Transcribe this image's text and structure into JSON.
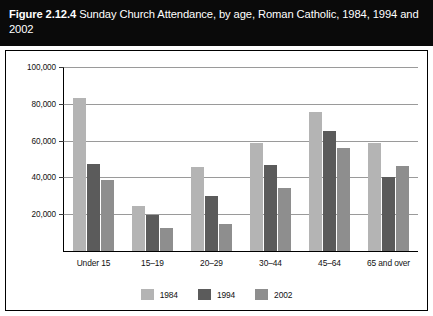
{
  "figure": {
    "number": "Figure 2.12.4",
    "caption": "Sunday Church Attendance, by age, Roman Catholic, 1984, 1994 and 2002"
  },
  "chart_data": {
    "type": "bar",
    "title": "Sunday Church Attendance, by age, Roman Catholic, 1984, 1994 and 2002",
    "xlabel": "",
    "ylabel": "",
    "ylim": [
      0,
      100000
    ],
    "yticks": [
      0,
      20000,
      40000,
      60000,
      80000,
      100000
    ],
    "ytick_labels": [
      "0",
      "20,000",
      "40,000",
      "60,000",
      "80,000",
      "100,000"
    ],
    "grid": true,
    "legend_position": "bottom",
    "categories": [
      "Under 15",
      "15–19",
      "20–29",
      "30–44",
      "45–64",
      "65 and over"
    ],
    "series": [
      {
        "name": "1984",
        "color": "#b4b4b4",
        "values": [
          83000,
          24500,
          45500,
          58500,
          75500,
          58500
        ]
      },
      {
        "name": "1994",
        "color": "#5b5b5b",
        "values": [
          47500,
          19500,
          30000,
          47000,
          65000,
          40000
        ]
      },
      {
        "name": "2002",
        "color": "#8e8e8e",
        "values": [
          38500,
          12500,
          14500,
          34000,
          56000,
          46000
        ]
      }
    ]
  }
}
